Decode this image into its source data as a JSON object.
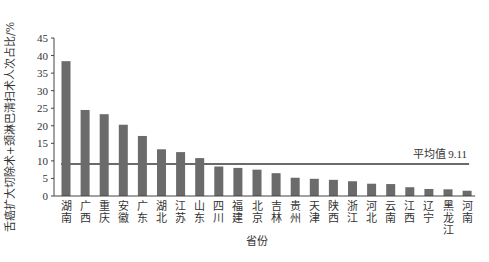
{
  "chart_data": {
    "type": "bar",
    "title": "",
    "xlabel": "省份",
    "ylabel": "舌癌扩大切除术+颈淋巴清扫术人次占比/%",
    "ylim": [
      0,
      45
    ],
    "yticks": [
      0,
      5,
      10,
      15,
      20,
      25,
      30,
      35,
      40,
      45
    ],
    "grid": false,
    "categories": [
      "湖南",
      "广西",
      "重庆",
      "安徽",
      "广东",
      "湖北",
      "江苏",
      "山东",
      "四川",
      "福建",
      "北京",
      "吉林",
      "贵州",
      "天津",
      "陕西",
      "浙江",
      "河北",
      "云南",
      "江西",
      "辽宁",
      "黑龙江",
      "河南"
    ],
    "values": [
      38.4,
      24.5,
      23.3,
      20.3,
      17.1,
      13.3,
      12.5,
      10.8,
      8.4,
      8.0,
      7.5,
      6.5,
      5.2,
      4.9,
      4.6,
      4.2,
      3.5,
      3.4,
      2.5,
      2.0,
      1.9,
      1.5
    ],
    "reference_line": {
      "label": "平均值",
      "value": 9.11,
      "display": "平均值 9.11"
    },
    "colors": {
      "bar": "#6b6b6b",
      "reference_line": "#6b6b6b",
      "axis": "#444444"
    }
  }
}
